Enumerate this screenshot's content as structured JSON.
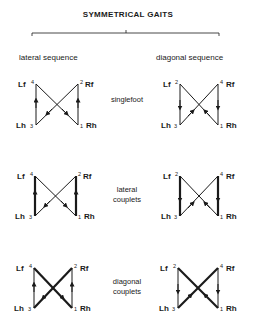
{
  "title": "SYMMETRICAL GAITS",
  "columns": {
    "left": "lateral sequence",
    "right": "diagonal sequence"
  },
  "rows": [
    {
      "label_line1": "singlefoot",
      "label_line2": "",
      "thick": "none"
    },
    {
      "label_line1": "lateral",
      "label_line2": "couplets",
      "thick": "vertical"
    },
    {
      "label_line1": "diagonal",
      "label_line2": "couplets",
      "thick": "diagonal"
    }
  ],
  "limbs": {
    "lf": "Lf",
    "rf": "Rf",
    "lh": "Lh",
    "rh": "Rh"
  },
  "lateral_sequence_order": {
    "rh": "1",
    "rf": "2",
    "lh": "3",
    "lf": "4"
  },
  "diagonal_sequence_order": {
    "rh": "1",
    "lf": "2",
    "lh": "3",
    "rf": "4"
  },
  "colors": {
    "ink": "#1a1a1a",
    "background": "#ffffff"
  }
}
